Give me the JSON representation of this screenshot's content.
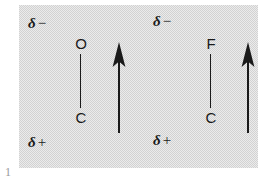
{
  "figure": {
    "panel": {
      "background_color": "#d2d2d2",
      "ink_color": "#1a1a1a"
    },
    "page_numeral": "1",
    "units": [
      {
        "id": "c-o-bond",
        "top_atom": "O",
        "bottom_atom": "C",
        "top_charge_symbol": "δ",
        "top_charge_sign": "−",
        "bottom_charge_symbol": "δ",
        "bottom_charge_sign": "+",
        "dipole_direction": "up",
        "dipole_label": "dipole-arrow-up"
      },
      {
        "id": "c-f-bond",
        "top_atom": "F",
        "bottom_atom": "C",
        "top_charge_symbol": "δ",
        "top_charge_sign": "−",
        "bottom_charge_symbol": "δ",
        "bottom_charge_sign": "+",
        "dipole_direction": "up",
        "dipole_label": "dipole-arrow-up"
      }
    ]
  }
}
